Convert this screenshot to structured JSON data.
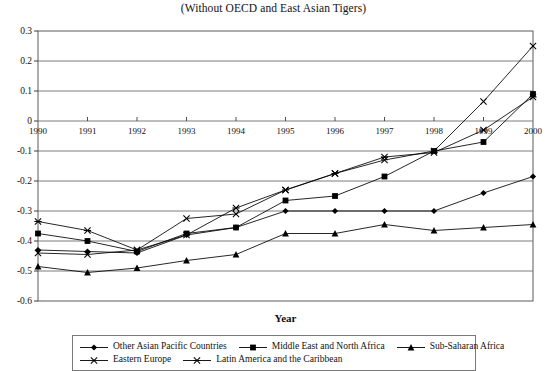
{
  "chart_data": {
    "type": "line",
    "title": "(Without OECD and East Asian Tigers)",
    "xlabel": "Year",
    "ylabel": "",
    "x": [
      1990,
      1991,
      1992,
      1993,
      1994,
      1995,
      1996,
      1997,
      1998,
      1999,
      2000
    ],
    "categories": [
      "1990",
      "1991",
      "1992",
      "1993",
      "1994",
      "1995",
      "1996",
      "1997",
      "1998",
      "1999",
      "2000"
    ],
    "xlim": [
      1990,
      2000
    ],
    "ylim": [
      -0.6,
      0.3
    ],
    "yticks": [
      0.3,
      0.2,
      0.1,
      0,
      -0.1,
      -0.2,
      -0.3,
      -0.4,
      -0.5,
      -0.6
    ],
    "ytick_labels": [
      "0.3",
      "0.2",
      "0.1",
      "0",
      "-0.1",
      "-0.2",
      "-0.3",
      "-0.4",
      "-0.5",
      "-0.6"
    ],
    "grid": true,
    "legend_position": "bottom",
    "series": [
      {
        "name": "Other Asian Pacific Countries",
        "marker": "diamond",
        "color": "#000000",
        "values": [
          -0.43,
          -0.435,
          -0.44,
          -0.38,
          -0.355,
          -0.3,
          -0.3,
          -0.3,
          -0.3,
          -0.24,
          -0.185
        ]
      },
      {
        "name": "Middle East and North Africa",
        "marker": "square",
        "color": "#000000",
        "values": [
          -0.375,
          -0.4,
          -0.435,
          -0.375,
          -0.355,
          -0.265,
          -0.25,
          -0.185,
          -0.1,
          -0.07,
          0.09
        ]
      },
      {
        "name": "Sub-Saharan Africa",
        "marker": "triangle",
        "color": "#000000",
        "values": [
          -0.485,
          -0.505,
          -0.49,
          -0.465,
          -0.445,
          -0.375,
          -0.375,
          -0.345,
          -0.365,
          -0.355,
          -0.345
        ]
      },
      {
        "name": "Eastern Europe",
        "marker": "x",
        "color": "#000000",
        "values": [
          -0.44,
          -0.445,
          -0.43,
          -0.325,
          -0.31,
          -0.23,
          -0.175,
          -0.13,
          -0.1,
          0.065,
          0.25
        ]
      },
      {
        "name": "Latin America and the Caribbean",
        "marker": "asterisk",
        "color": "#000000",
        "values": [
          -0.335,
          -0.365,
          -0.43,
          -0.38,
          -0.29,
          -0.23,
          -0.175,
          -0.12,
          -0.105,
          -0.03,
          0.08
        ]
      }
    ]
  },
  "legend": {
    "rows": [
      [
        "Other Asian Pacific Countries",
        "Middle East and North Africa",
        "Sub-Saharan Africa"
      ],
      [
        "Eastern Europe",
        "Latin America and the Caribbean"
      ]
    ]
  }
}
